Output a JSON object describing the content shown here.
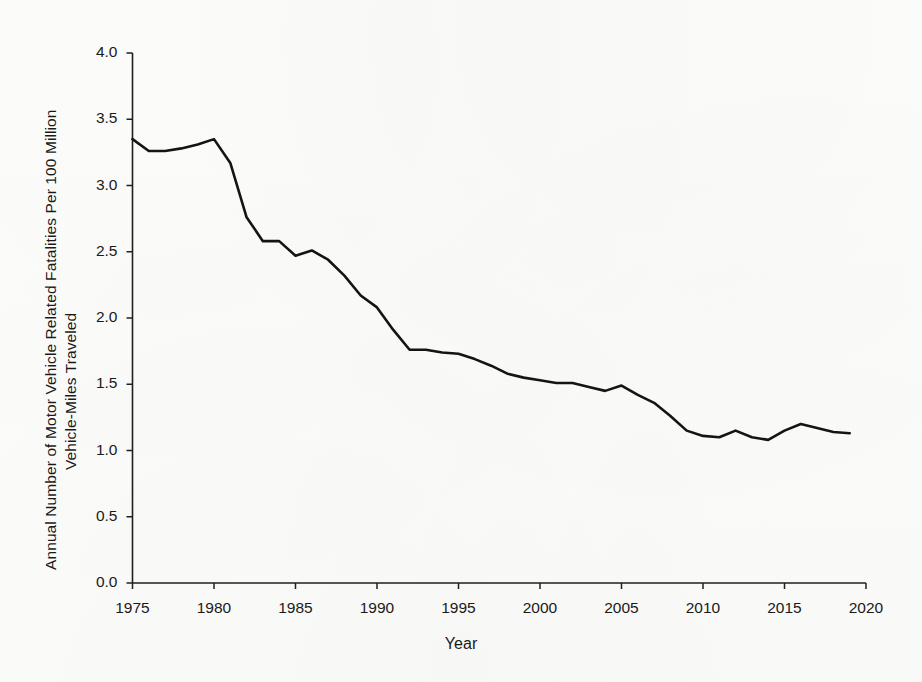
{
  "chart_data": {
    "type": "line",
    "title": "",
    "xlabel": "Year",
    "ylabel": "Annual Number of Motor Vehicle Related Fatalities Per 100 Million Vehicle-Miles Traveled",
    "ylabel_line1": "Annual Number of Motor Vehicle Related Fatalities Per 100 Million",
    "ylabel_line2": "Vehicle-Miles Traveled",
    "xlim": [
      1975,
      2020
    ],
    "ylim": [
      0.0,
      4.0
    ],
    "grid": false,
    "legend": "none",
    "line_color": "#141414",
    "x_ticks": [
      1975,
      1980,
      1985,
      1990,
      1995,
      2000,
      2005,
      2010,
      2015,
      2020
    ],
    "x_tick_labels": [
      "1975",
      "1980",
      "1985",
      "1990",
      "1995",
      "2000",
      "2005",
      "2010",
      "2015",
      "2020"
    ],
    "y_ticks": [
      0.0,
      0.5,
      1.0,
      1.5,
      2.0,
      2.5,
      3.0,
      3.5,
      4.0
    ],
    "y_tick_labels": [
      "0.0",
      "0.5",
      "1.0",
      "1.5",
      "2.0",
      "2.5",
      "3.0",
      "3.5",
      "4.0"
    ],
    "x": [
      1975,
      1976,
      1977,
      1978,
      1979,
      1980,
      1981,
      1982,
      1983,
      1984,
      1985,
      1986,
      1987,
      1988,
      1989,
      1990,
      1991,
      1992,
      1993,
      1994,
      1995,
      1996,
      1997,
      1998,
      1999,
      2000,
      2001,
      2002,
      2003,
      2004,
      2005,
      2006,
      2007,
      2008,
      2009,
      2010,
      2011,
      2012,
      2013,
      2014,
      2015,
      2016,
      2017,
      2018,
      2019
    ],
    "values": [
      3.35,
      3.26,
      3.26,
      3.28,
      3.31,
      3.35,
      3.17,
      2.76,
      2.58,
      2.58,
      2.47,
      2.51,
      2.44,
      2.32,
      2.17,
      2.08,
      1.91,
      1.76,
      1.76,
      1.74,
      1.73,
      1.69,
      1.64,
      1.58,
      1.55,
      1.53,
      1.51,
      1.51,
      1.48,
      1.45,
      1.49,
      1.42,
      1.36,
      1.26,
      1.15,
      1.11,
      1.1,
      1.15,
      1.1,
      1.08,
      1.15,
      1.2,
      1.17,
      1.14,
      1.13
    ],
    "series_name": "Fatality rate per 100 million VMT"
  },
  "figure": {
    "background_color": "#fdfdfb",
    "ink_color": "#1a1a1a"
  }
}
